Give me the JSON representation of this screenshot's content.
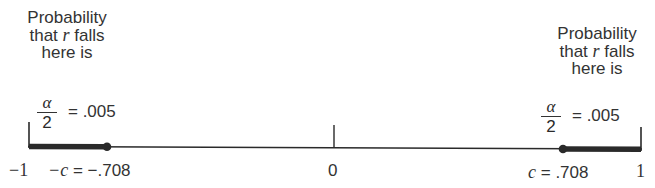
{
  "left_annotation": {
    "lines": [
      "Probability",
      "that",
      "r",
      "falls",
      "here is"
    ],
    "fraction": {
      "numerator": "α",
      "denominator": "2"
    },
    "equals_value": "= .005"
  },
  "right_annotation": {
    "lines": [
      "Probability",
      "that",
      "r",
      "falls",
      "here is"
    ],
    "fraction": {
      "numerator": "α",
      "denominator": "2"
    },
    "equals_value": "= .005"
  },
  "axis": {
    "labels": {
      "left_end": "−1",
      "neg_c_var": "−c",
      "neg_c_value": "= −.708",
      "zero": "0",
      "c_var": "c",
      "c_value": "= .708",
      "right_end": "1"
    },
    "range": [
      -1,
      1
    ],
    "critical_value": 0.708,
    "tail_probability": 0.005
  },
  "colors": {
    "line": "#2a2a2a",
    "text": "#333333"
  }
}
